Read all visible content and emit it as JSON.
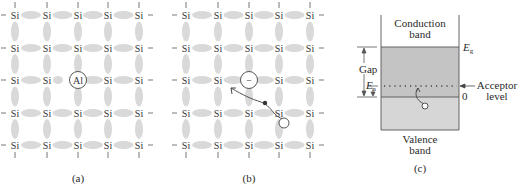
{
  "figure": {
    "panels": [
      {
        "id": "a",
        "caption": "(a)",
        "atom_label": "Si",
        "impurity": {
          "label": "Al",
          "row": 2,
          "col": 2
        }
      },
      {
        "id": "b",
        "caption": "(b)",
        "atom_label": "Si",
        "impurity": {
          "label": "−",
          "row": 2,
          "col": 2
        },
        "annotations": [
          "hole-migration-arrow",
          "electron-dot",
          "hole-circle"
        ]
      },
      {
        "id": "c",
        "caption": "(c)",
        "conduction_band_label_line1": "Conduction",
        "conduction_band_label_line2": "band",
        "valence_band_label_line1": "Valence",
        "valence_band_label_line2": "band",
        "gap_label": "Gap",
        "eg_label": "E",
        "eg_subscript": "g",
        "ea_label": "E",
        "ea_subscript": "a",
        "zero_label": "0",
        "acceptor_label_line1": "Acceptor",
        "acceptor_label_line2": "level"
      }
    ],
    "lattice": {
      "rows": 5,
      "cols": 5,
      "x_positions": [
        15,
        47,
        78,
        108,
        139
      ],
      "y_positions": [
        15,
        48,
        80,
        113,
        145
      ],
      "panel_b_offset_x": 171
    },
    "colors": {
      "bond": "#d9d9d9",
      "gap_fill": "#c4c4c4",
      "valence_fill": "#d6d6d6",
      "line": "#555555",
      "text": "#2a2a2a"
    }
  }
}
